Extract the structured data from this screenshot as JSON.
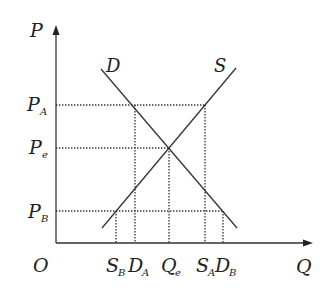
{
  "diagram": {
    "title": "",
    "axes": {
      "y_label": "P",
      "x_label": "Q",
      "origin_label": "O"
    },
    "curves": {
      "demand": {
        "label": "D"
      },
      "supply": {
        "label": "S"
      }
    },
    "price_levels": [
      {
        "main": "P",
        "sub": "A"
      },
      {
        "main": "P",
        "sub": "e"
      },
      {
        "main": "P",
        "sub": "B"
      }
    ],
    "quantity_levels": [
      {
        "main": "S",
        "sub": "B"
      },
      {
        "main": "D",
        "sub": "A"
      },
      {
        "main": "Q",
        "sub": "e"
      },
      {
        "main": "S",
        "sub": "A"
      },
      {
        "main": "D",
        "sub": "B"
      }
    ],
    "colors": {
      "line": "#333333",
      "guide": "#333333",
      "background": "#ffffff"
    }
  }
}
